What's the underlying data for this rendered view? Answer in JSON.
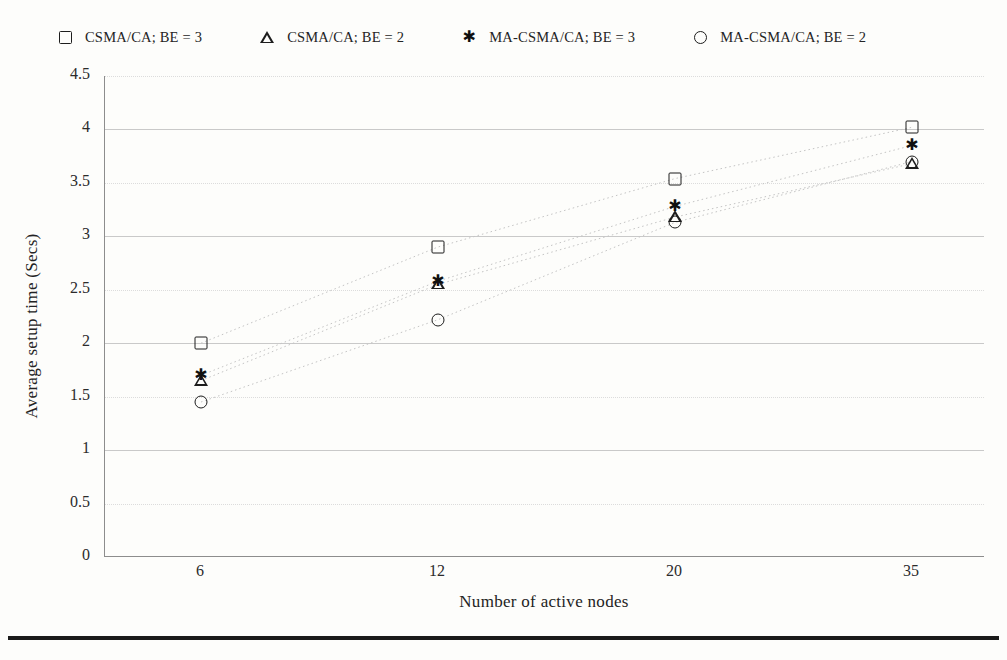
{
  "figure": {
    "background": "#fdfdfb",
    "axis_color": "#8d8d8d",
    "marker_color": "#1d1d1d",
    "grid_color": "#c9c9c9",
    "bottom_rule_color": "#1a1a1a"
  },
  "legend": {
    "position": "top",
    "entries": [
      {
        "marker": "square-marker-icon",
        "label": "CSMA/CA; BE = 3"
      },
      {
        "marker": "triangle-marker-icon",
        "label": "CSMA/CA; BE = 2"
      },
      {
        "marker": "star-marker-icon",
        "label": "MA-CSMA/CA; BE = 3"
      },
      {
        "marker": "circle-marker-icon",
        "label": "MA-CSMA/CA; BE = 2"
      }
    ]
  },
  "axes": {
    "y_title": "Average setup time (Secs)",
    "x_title": "Number of active nodes",
    "y_ticks": [
      "4.5",
      "4",
      "3.5",
      "3",
      "2.5",
      "2",
      "1.5",
      "1",
      "0.5",
      "0"
    ],
    "x_ticks": [
      "6",
      "12",
      "20",
      "35"
    ]
  },
  "chart_data": {
    "type": "scatter",
    "title": "",
    "xlabel": "Number of active nodes",
    "ylabel": "Average setup time (Secs)",
    "categories": [
      "6",
      "12",
      "20",
      "35"
    ],
    "x": [
      6,
      12,
      20,
      35
    ],
    "ylim": [
      0,
      4.5
    ],
    "ytick_step": 0.5,
    "grid": true,
    "legend_position": "top",
    "connector_lines": "dotted",
    "series": [
      {
        "name": "CSMA/CA; BE = 3",
        "marker": "square",
        "values": [
          2.0,
          2.9,
          3.54,
          4.02
        ]
      },
      {
        "name": "CSMA/CA; BE = 2",
        "marker": "triangle",
        "values": [
          1.65,
          2.55,
          3.18,
          3.68
        ]
      },
      {
        "name": "MA-CSMA/CA; BE = 3",
        "marker": "star",
        "values": [
          1.7,
          2.58,
          3.28,
          3.85
        ]
      },
      {
        "name": "MA-CSMA/CA; BE = 2",
        "marker": "circle",
        "values": [
          1.45,
          2.22,
          3.13,
          3.7
        ]
      }
    ]
  }
}
